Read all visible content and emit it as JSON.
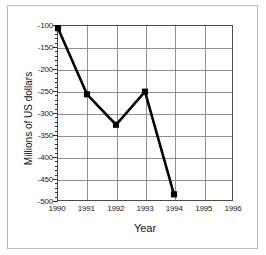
{
  "chart_data": {
    "type": "line",
    "title": "",
    "xlabel": "Year",
    "ylabel": "Millions of US dollars",
    "xlim": [
      1990,
      1996
    ],
    "ylim": [
      -500,
      -100
    ],
    "grid": true,
    "legend": false,
    "x": [
      1990,
      1991,
      1992,
      1993,
      1994
    ],
    "values": [
      -105,
      -257,
      -327,
      -251,
      -487
    ],
    "series": [
      {
        "name": "Millions of US dollars",
        "x": [
          1990,
          1991,
          1992,
          1993,
          1994
        ],
        "values": [
          -105,
          -257,
          -327,
          -251,
          -487
        ],
        "color": "#000000",
        "marker": "square"
      }
    ],
    "xticks": [
      1990,
      1991,
      1992,
      1993,
      1994,
      1995,
      1996
    ],
    "xtick_labels": [
      "1990",
      "1991",
      "1992",
      "1993",
      "1994",
      "1995",
      "1996"
    ],
    "yticks": [
      -100,
      -150,
      -200,
      -250,
      -300,
      -350,
      -400,
      -450,
      -500
    ],
    "ytick_labels": [
      "-100",
      "-150",
      "-200",
      "-250",
      "-300",
      "-350",
      "-400",
      "-450",
      "-500"
    ]
  },
  "style": {
    "line_color": "#000000",
    "marker_color": "#000000",
    "grid_color": "#8f8f8f",
    "axis_color": "#4a4a4a",
    "frame_color": "#b9b9b9",
    "background": "#ffffff"
  }
}
